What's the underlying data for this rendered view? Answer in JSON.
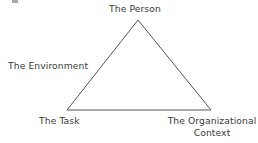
{
  "figure": {
    "background_color": "#ffffff",
    "stroke_color": "#555555",
    "text_color": "#3a3a3a"
  },
  "diagram": {
    "type": "triangle",
    "vertices": {
      "apex": {
        "x": 138,
        "y": 20
      },
      "bottom_left": {
        "x": 67,
        "y": 110
      },
      "bottom_right": {
        "x": 211,
        "y": 110
      }
    }
  },
  "labels": {
    "top": "The Person",
    "left": "The Environment",
    "bottom_left": "The Task",
    "bottom_right_line1": "The Organizational",
    "bottom_right_line2": "Context"
  }
}
